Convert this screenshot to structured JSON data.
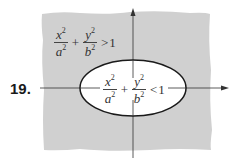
{
  "problem_number": "19.",
  "outer_inequality": {
    "term1": {
      "num": "x",
      "num_exp": "2",
      "den": "a",
      "den_exp": "2"
    },
    "plus": "+",
    "term2": {
      "num": "y",
      "num_exp": "2",
      "den": "b",
      "den_exp": "2"
    },
    "relation": ">",
    "rhs": "1"
  },
  "inner_inequality": {
    "term1": {
      "num": "x",
      "num_exp": "2",
      "den": "a",
      "den_exp": "2"
    },
    "plus": "+",
    "term2": {
      "num": "y",
      "num_exp": "2",
      "den": "b",
      "den_exp": "2"
    },
    "relation": "<",
    "rhs": "1"
  },
  "colors": {
    "shaded_region": "#d0d0d0",
    "ellipse_fill": "#ffffff",
    "ellipse_stroke": "#1a1a1a",
    "axis": "#333333"
  }
}
